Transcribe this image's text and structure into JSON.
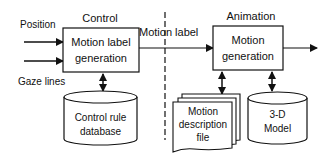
{
  "sections": {
    "control": "Control",
    "animation": "Animation"
  },
  "inputs": {
    "position": "Position",
    "gaze_lines": "Gaze lines"
  },
  "boxes": {
    "motion_label_generation": [
      "Motion label",
      "generation"
    ],
    "motion_generation": [
      "Motion",
      "generation"
    ]
  },
  "connector": {
    "motion_label": "Motion label"
  },
  "stores": {
    "control_rule_database": [
      "Control rule",
      "database"
    ],
    "motion_description_file": [
      "Motion",
      "description",
      "file"
    ],
    "model_3d": [
      "3-D",
      "Model"
    ]
  }
}
